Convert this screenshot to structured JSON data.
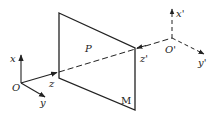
{
  "diagram": {
    "type": "coordinate-projection",
    "plane": {
      "label": "P",
      "corner_label": "M"
    },
    "frame_origin": {
      "origin_label": "O",
      "axes": {
        "x": "x",
        "y": "y",
        "z": "z"
      }
    },
    "frame_prime": {
      "origin_label": "O'",
      "axes": {
        "x": "x'",
        "y": "y'",
        "z": "z'"
      }
    },
    "colors": {
      "stroke": "#222222",
      "background": "#ffffff"
    }
  }
}
